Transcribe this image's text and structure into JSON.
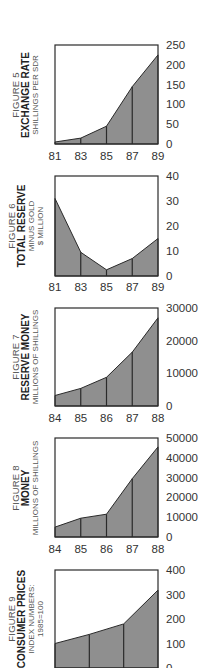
{
  "chart_data": [
    {
      "type": "area",
      "figure_label": "FIGURE 5",
      "title": "EXCHANGE RATE",
      "subtitle": [
        "SHILLINGS PER SDR"
      ],
      "xlabel": "",
      "ylabel": "SHILLINGS PER SDR",
      "categories": [
        "81",
        "82",
        "83",
        "84",
        "85",
        "86",
        "87",
        "88",
        "89"
      ],
      "x_tick_labels": [
        "81",
        "83",
        "85",
        "87",
        "89"
      ],
      "x": [
        81,
        83,
        85,
        87,
        89
      ],
      "values": [
        5,
        15,
        45,
        145,
        225
      ],
      "y_ticks": [
        "0",
        "50",
        "100",
        "150",
        "200",
        "250"
      ],
      "ylim": [
        0,
        250
      ],
      "grid": "vertical lines at each x tick",
      "legend": "none"
    },
    {
      "type": "area",
      "figure_label": "FIGURE 6",
      "title": "TOTAL RESERVE",
      "subtitle": [
        "MINUS GOLD",
        "$ MILLION"
      ],
      "xlabel": "",
      "ylabel": "$ MILLION",
      "x_tick_labels": [
        "81",
        "83",
        "85",
        "87",
        "89"
      ],
      "x": [
        81,
        83,
        85,
        87,
        89
      ],
      "values": [
        31,
        9.5,
        2.5,
        7,
        15
      ],
      "y_ticks": [
        "0",
        "10",
        "20",
        "30",
        "40"
      ],
      "ylim": [
        0,
        40
      ],
      "grid": "vertical lines at each x tick",
      "legend": "none"
    },
    {
      "type": "area",
      "figure_label": "FIGURE  7",
      "title": "RESERVE MONEY",
      "subtitle": [
        "MILLIONS OF SHILLINGS"
      ],
      "xlabel": "",
      "ylabel": "MILLIONS OF SHILLINGS",
      "x_tick_labels": [
        "84",
        "85",
        "86",
        "87",
        "88"
      ],
      "x": [
        84,
        85,
        86,
        87,
        88
      ],
      "values": [
        3200,
        5400,
        8800,
        16500,
        27000
      ],
      "y_ticks": [
        "0",
        "10000",
        "20000",
        "30000"
      ],
      "ylim": [
        0,
        30000
      ],
      "grid": "vertical lines at each x tick",
      "legend": "none"
    },
    {
      "type": "area",
      "figure_label": "FIGURE  8",
      "title": "MONEY",
      "subtitle": [
        "MILLIONS OF SHILLINGS"
      ],
      "xlabel": "",
      "ylabel": "MILLIONS OF SHILLINGS",
      "x_tick_labels": [
        "84",
        "85",
        "86",
        "87",
        "88"
      ],
      "x": [
        84,
        85,
        86,
        87,
        88
      ],
      "values": [
        5000,
        9500,
        11500,
        29500,
        45500
      ],
      "y_ticks": [
        "0",
        "10000",
        "20000",
        "30000",
        "40000",
        "50000"
      ],
      "ylim": [
        0,
        50000
      ],
      "grid": "vertical lines at each x tick",
      "legend": "none"
    },
    {
      "type": "area",
      "figure_label": "FIGURE  9",
      "title": "CONSUMER PRICES",
      "subtitle": [
        "INDEX NUMBERS:",
        "1985=100"
      ],
      "xlabel": "",
      "ylabel": "INDEX NUMBERS: 1985=100",
      "x_tick_labels": [],
      "x": [
        0,
        1,
        2,
        3
      ],
      "values": [
        100,
        137,
        180,
        318
      ],
      "y_ticks": [
        "0",
        "100",
        "200",
        "300",
        "400"
      ],
      "ylim": [
        0,
        400
      ],
      "grid": "vertical lines at each x point",
      "legend": "none",
      "note": "bottom of figure cropped in screenshot"
    }
  ],
  "style": {
    "fill_color": "#8f8f8f",
    "line_color": "#2a2a2a",
    "frame_color": "#2a2a2a",
    "text_color": "#333333"
  },
  "layout": {
    "frames": [
      {
        "top": 45,
        "bottom": 144,
        "label_y": 160
      },
      {
        "top": 176,
        "bottom": 276,
        "label_y": 291
      },
      {
        "top": 308,
        "bottom": 406,
        "label_y": 422
      },
      {
        "top": 438,
        "bottom": 537,
        "label_y": 553
      },
      {
        "top": 570,
        "bottom": 668,
        "label_y": 690
      }
    ],
    "frame_left": 55,
    "frame_right": 158
  }
}
